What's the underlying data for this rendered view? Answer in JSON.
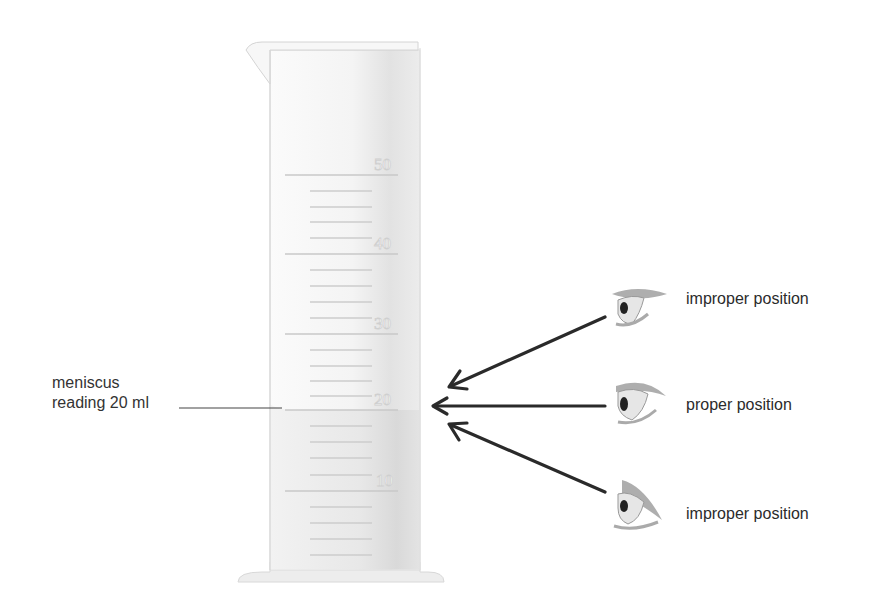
{
  "diagram": {
    "cylinder": {
      "unit": "ml",
      "graduations": [
        {
          "value": "50",
          "y": 175
        },
        {
          "value": "40",
          "y": 254
        },
        {
          "value": "30",
          "y": 334
        },
        {
          "value": "20",
          "y": 410
        },
        {
          "value": "10",
          "y": 491
        }
      ],
      "minor_lines_y": [
        191,
        207,
        222,
        238,
        270,
        286,
        302,
        318,
        350,
        366,
        381,
        396,
        426,
        442,
        458,
        475,
        507,
        523,
        539,
        555
      ]
    },
    "meniscus_label": {
      "line1": "meniscus",
      "line2": "reading 20 ml"
    },
    "eyes": [
      {
        "label": "improper position",
        "position": "above"
      },
      {
        "label": "proper position",
        "position": "level"
      },
      {
        "label": "improper position",
        "position": "below"
      }
    ],
    "colors": {
      "arrow": "#2a2a2a",
      "text": "#333333",
      "cylinder_outline": "#d6d6d6"
    }
  }
}
